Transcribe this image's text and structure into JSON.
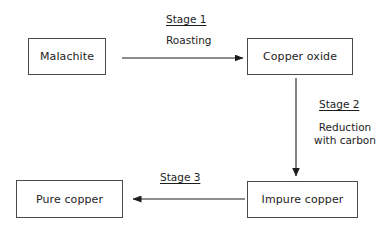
{
  "diagram": {
    "line_color": "#4a4a4a",
    "text_color": "#1d1d1d",
    "background_color": "#ffffff",
    "nodes": [
      {
        "id": "malachite",
        "label": "Malachite"
      },
      {
        "id": "copper_oxide",
        "label": "Copper oxide"
      },
      {
        "id": "impure_copper",
        "label": "Impure copper"
      },
      {
        "id": "pure_copper",
        "label": "Pure copper"
      }
    ],
    "edges": [
      {
        "id": "edge_1",
        "from": "malachite",
        "to": "copper_oxide",
        "direction": "right",
        "stage": "Stage 1",
        "process": "Roasting"
      },
      {
        "id": "edge_2",
        "from": "copper_oxide",
        "to": "impure_copper",
        "direction": "down",
        "stage": "Stage 2",
        "process_line_1": "Reduction",
        "process_line_2": "with carbon"
      },
      {
        "id": "edge_3",
        "from": "impure_copper",
        "to": "pure_copper",
        "direction": "left",
        "stage": "Stage 3",
        "process": ""
      }
    ]
  }
}
